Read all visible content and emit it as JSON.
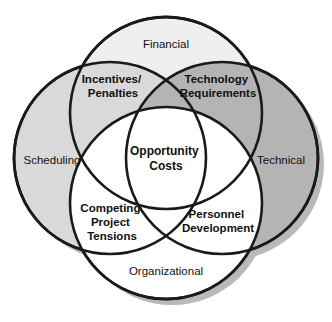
{
  "diagram": {
    "type": "venn-4-circle",
    "colors": {
      "background": "#ffffff",
      "circle_fill": "#efefef",
      "pair_overlap_fill": "#d9d9d9",
      "triple_overlap_fill": "#b4b4b4",
      "center_fill": "#ffffff",
      "outer_stroke": "#1a1a1a",
      "inner_stroke": "#6e6e6e",
      "shadow": "#b9b9b9",
      "text": "#111111"
    },
    "outer_labels": [
      {
        "id": "financial",
        "text": "Financial",
        "x": 166,
        "y": 45
      },
      {
        "id": "scheduling",
        "text": "Scheduling",
        "x": 52,
        "y": 161
      },
      {
        "id": "technical",
        "text": "Technical",
        "x": 281,
        "y": 161
      },
      {
        "id": "organizational",
        "text": "Organizational",
        "x": 166,
        "y": 272
      }
    ],
    "overlap_labels": [
      {
        "id": "incentives-penalties",
        "lines": [
          "Incentives/",
          "Penalties"
        ],
        "x": 113,
        "y": 86,
        "between": [
          "Financial",
          "Scheduling"
        ]
      },
      {
        "id": "technology-requirements",
        "lines": [
          "Technology",
          "Requirements"
        ],
        "x": 217,
        "y": 86,
        "between": [
          "Financial",
          "Technical"
        ]
      },
      {
        "id": "competing-project-tensions",
        "lines": [
          "Competing",
          "Project",
          "Tensions"
        ],
        "x": 112,
        "y": 216,
        "between": [
          "Scheduling",
          "Organizational"
        ]
      },
      {
        "id": "personnel-development",
        "lines": [
          "Personnel",
          "Development"
        ],
        "x": 217,
        "y": 220,
        "between": [
          "Technical",
          "Organizational"
        ]
      }
    ],
    "center_label": {
      "id": "opportunity-costs",
      "lines": [
        "Opportunity",
        "Costs"
      ],
      "x": 166,
      "y": 158
    },
    "geometry": {
      "circles": [
        {
          "id": "financial",
          "cx": 166,
          "cy": 113,
          "r": 96
        },
        {
          "id": "scheduling",
          "cx": 110,
          "cy": 158,
          "r": 96
        },
        {
          "id": "technical",
          "cx": 222,
          "cy": 158,
          "r": 96
        },
        {
          "id": "organizational",
          "cx": 166,
          "cy": 203,
          "r": 96
        }
      ],
      "shadow_offset": {
        "x": 6,
        "y": 6
      }
    }
  }
}
